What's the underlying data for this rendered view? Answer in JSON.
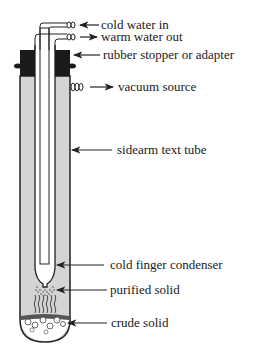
{
  "labels": {
    "cold_water_in": "cold water in",
    "warm_water_out": "warm water out",
    "stopper": "rubber stopper or adapter",
    "vacuum": "vacuum source",
    "sidearm": "sidearm text tube",
    "cold_finger": "cold finger condenser",
    "purified": "purified solid",
    "crude": "crude solid"
  },
  "colors": {
    "glass_wall": "#d4d4d4",
    "stopper": "#1a1a1a",
    "outline": "#222222",
    "background": "#ffffff"
  }
}
